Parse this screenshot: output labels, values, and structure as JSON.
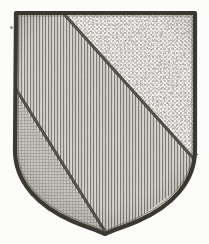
{
  "image": {
    "kind": "heraldic-shield-engraving",
    "title": "Heraldic Shield",
    "width": 209,
    "height": 244,
    "background_color": "#fdfdfc",
    "medium": "scanned line engraving"
  },
  "shield": {
    "name": "escutcheon",
    "outline_color": "#3a3732",
    "outline_width": 4,
    "inner_outline_color": "#5d5952",
    "top_left": {
      "x": 16,
      "y": 13
    },
    "top_right": {
      "x": 195,
      "y": 13
    },
    "bottom_point": {
      "x": 105,
      "y": 234
    },
    "shape_description": "straight chief, straight flanks to mid-height, then curving inward to a notched point at base"
  },
  "divisions": [
    {
      "id": "upper-right",
      "label": "chief-dexter-field",
      "tincture_hatching": "stipple",
      "tincture_name": "sable-stipple",
      "base_color": "#f2f0ec",
      "mark_color": "#4a4741",
      "position": "above the upper bend line, toward the top-right"
    },
    {
      "id": "middle-band",
      "label": "bend",
      "tincture_hatching": "vertical-lines",
      "tincture_name": "gules-vertical",
      "base_color": "#dedad3",
      "mark_color": "#6b6761",
      "position": "broad diagonal band between the two bend lines"
    },
    {
      "id": "lower-left",
      "label": "base-sinister-field",
      "tincture_hatching": "cross-hatch-grain",
      "tincture_name": "grain-crosshatch",
      "base_color": "#d3cfc8",
      "mark_color": "#75716b",
      "position": "below the lower bend line, toward the bottom-left"
    }
  ],
  "bend_lines": [
    {
      "id": "upper-bend-line",
      "from": {
        "x": 63,
        "y": 14
      },
      "to": {
        "x": 193,
        "y": 158
      },
      "color": "#403d37",
      "width": 3
    },
    {
      "id": "lower-bend-line",
      "from": {
        "x": 17,
        "y": 90
      },
      "to": {
        "x": 106,
        "y": 232
      },
      "color": "#403d37",
      "width": 3
    }
  ],
  "artifacts": [
    {
      "id": "speck",
      "name": "ink-speck",
      "x": 10,
      "y": 27,
      "size": 3
    }
  ],
  "palette": {
    "paper": "#fdfdfc",
    "ink_dark": "#3a3732",
    "ink_mid": "#6b6761",
    "ink_light": "#a9a49c",
    "field_light": "#f2f0ec",
    "field_mid": "#dedad3",
    "field_dark": "#d3cfc8"
  }
}
